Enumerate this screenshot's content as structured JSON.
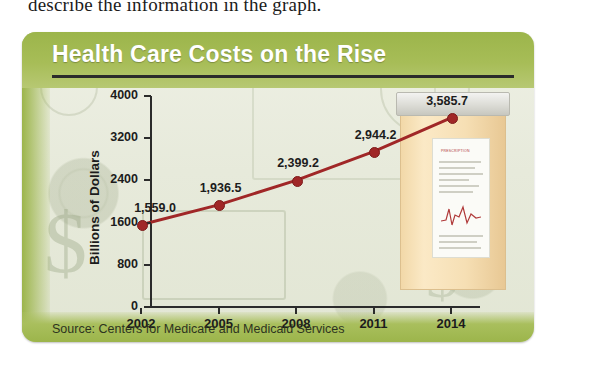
{
  "page": {
    "above_text": "describe the information in the graph."
  },
  "figure": {
    "title": "Health Care Costs on the Rise",
    "source": "Source: Centers for Medicare and Medicaid Services",
    "bottle_label_text": "PRESCRIPTION"
  },
  "colors": {
    "band_green": "#9cb54b",
    "line_red": "#a02727",
    "axis_black": "#2b2b2b",
    "card_bg": "#eceee1",
    "bottle_body": "#f6dfb4"
  },
  "chart_data": {
    "type": "line",
    "title": "Health Care Costs on the Rise",
    "xlabel": "",
    "ylabel": "Billions of Dollars",
    "categories": [
      "2002",
      "2005",
      "2008",
      "2011",
      "2014"
    ],
    "values": [
      1559.0,
      1936.5,
      2399.2,
      2944.2,
      3585.7
    ],
    "point_labels": [
      "1,559.0",
      "1,936.5",
      "2,399.2",
      "2,944.2",
      "3,585.7"
    ],
    "ylim": [
      0,
      4000
    ],
    "yticks": [
      0,
      800,
      1600,
      2400,
      3200,
      4000
    ],
    "ytick_labels": [
      "0",
      "800",
      "1600",
      "2400",
      "3200",
      "4000"
    ],
    "grid": false,
    "legend": "none",
    "marker": "circle",
    "series": [
      {
        "name": "National health expenditures",
        "values": [
          1559.0,
          1936.5,
          2399.2,
          2944.2,
          3585.7
        ]
      }
    ],
    "annotations": [
      "Source: Centers for Medicare and Medicaid Services"
    ]
  }
}
